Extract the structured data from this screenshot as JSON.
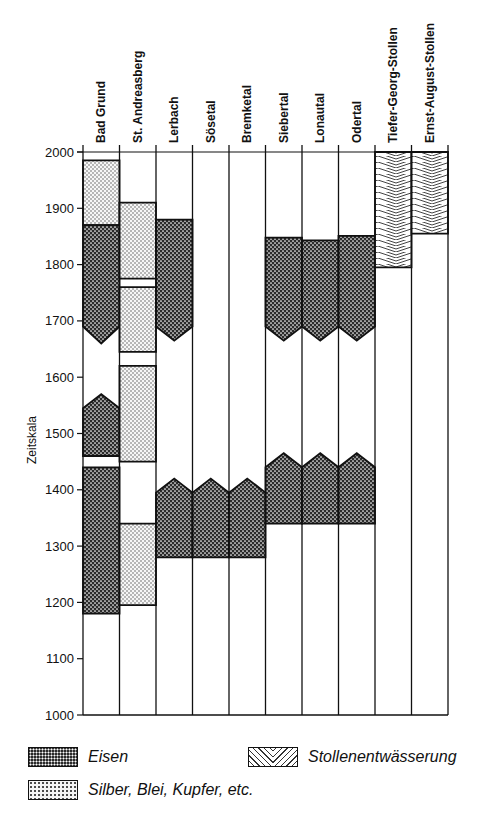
{
  "chart_data": {
    "type": "timeline-bar",
    "title": "",
    "ylabel": "Zeitskala",
    "ylim": [
      1000,
      2000
    ],
    "yticks": [
      1000,
      1100,
      1200,
      1300,
      1400,
      1500,
      1600,
      1700,
      1800,
      1900,
      2000
    ],
    "categories": [
      "Bad Grund",
      "St. Andreasberg",
      "Lerbach",
      "Sösetal",
      "Bremketal",
      "Siebertal",
      "Lonautal",
      "Odertal",
      "Tiefer-Georg-Stollen",
      "Ernst-August-Stollen"
    ],
    "legend": [
      {
        "key": "eisen",
        "label": "Eisen"
      },
      {
        "key": "silber",
        "label": "Silber, Blei, Kupfer, etc."
      },
      {
        "key": "stollen",
        "label": "Stollenentwässerung"
      }
    ],
    "intervals": [
      {
        "column": 0,
        "type": "silber",
        "start": 1870,
        "end": 1985
      },
      {
        "column": 0,
        "type": "eisen",
        "start": 1690,
        "end": 1870,
        "bottom_point": 1660
      },
      {
        "column": 0,
        "type": "eisen",
        "start": 1460,
        "end": 1545,
        "top_point": 1570
      },
      {
        "column": 0,
        "type": "eisen",
        "start": 1180,
        "end": 1440
      },
      {
        "column": 1,
        "type": "silber",
        "start": 1775,
        "end": 1910
      },
      {
        "column": 1,
        "type": "silber",
        "start": 1645,
        "end": 1760
      },
      {
        "column": 1,
        "type": "silber",
        "start": 1450,
        "end": 1620
      },
      {
        "column": 1,
        "type": "silber",
        "start": 1195,
        "end": 1340
      },
      {
        "column": 2,
        "type": "eisen",
        "start": 1690,
        "end": 1880,
        "bottom_point": 1665
      },
      {
        "column": 2,
        "type": "eisen",
        "start": 1280,
        "end": 1395,
        "top_point": 1420
      },
      {
        "column": 3,
        "type": "eisen",
        "start": 1280,
        "end": 1395,
        "top_point": 1420
      },
      {
        "column": 4,
        "type": "eisen",
        "start": 1280,
        "end": 1395,
        "top_point": 1420
      },
      {
        "column": 5,
        "type": "eisen",
        "start": 1690,
        "end": 1848,
        "bottom_point": 1665
      },
      {
        "column": 5,
        "type": "eisen",
        "start": 1340,
        "end": 1440,
        "top_point": 1465
      },
      {
        "column": 6,
        "type": "eisen",
        "start": 1690,
        "end": 1843,
        "bottom_point": 1665
      },
      {
        "column": 6,
        "type": "eisen",
        "start": 1340,
        "end": 1440,
        "top_point": 1465
      },
      {
        "column": 7,
        "type": "eisen",
        "start": 1690,
        "end": 1851,
        "bottom_point": 1665
      },
      {
        "column": 7,
        "type": "eisen",
        "start": 1340,
        "end": 1440,
        "top_point": 1465
      },
      {
        "column": 8,
        "type": "stollen",
        "start": 1795,
        "end": 2000
      },
      {
        "column": 9,
        "type": "stollen",
        "start": 1855,
        "end": 2000
      }
    ],
    "grid": false,
    "legend_position": "bottom"
  },
  "legend_labels": {
    "eisen": "Eisen",
    "silber": "Silber, Blei, Kupfer, etc.",
    "stollen": "Stollenentwässerung"
  }
}
